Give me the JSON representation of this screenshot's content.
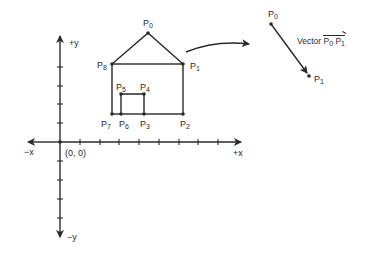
{
  "axes": {
    "pos_y_label": "+y",
    "neg_y_label": "−y",
    "pos_x_label": "+x",
    "neg_x_label": "−x",
    "origin_label": "(0, 0)"
  },
  "house_points": [
    {
      "id": "P0",
      "base": "P",
      "sub": "0"
    },
    {
      "id": "P1",
      "base": "P",
      "sub": "1"
    },
    {
      "id": "P2",
      "base": "P",
      "sub": "2"
    },
    {
      "id": "P3",
      "base": "P",
      "sub": "3"
    },
    {
      "id": "P4",
      "base": "P",
      "sub": "4"
    },
    {
      "id": "P5",
      "base": "P",
      "sub": "5"
    },
    {
      "id": "P6",
      "base": "P",
      "sub": "6"
    },
    {
      "id": "P7",
      "base": "P",
      "sub": "7"
    },
    {
      "id": "P8",
      "base": "P",
      "sub": "8"
    }
  ],
  "vector": {
    "start": {
      "base": "P",
      "sub": "0"
    },
    "end": {
      "base": "P",
      "sub": "1"
    },
    "label_prefix": "Vector",
    "label_p0_base": "P",
    "label_p0_sub": "0",
    "label_p1_base": "P",
    "label_p1_sub": "1"
  },
  "colors": {
    "ink": "#2a2a2a",
    "background": "#ffffff"
  }
}
